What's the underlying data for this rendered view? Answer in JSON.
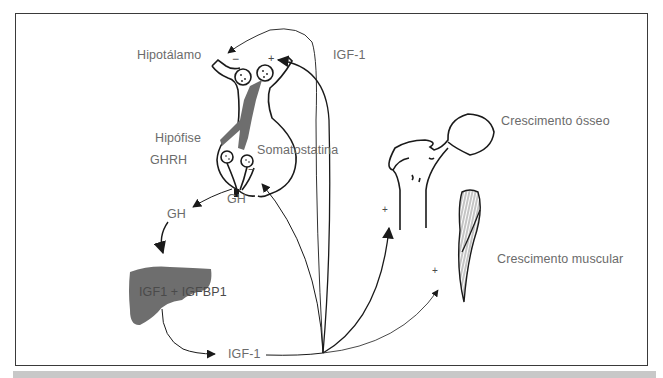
{
  "diagram": {
    "colors": {
      "frame": "#3a3a3a",
      "label": "#6b6b6b",
      "organ_fill": "#6e6e6e",
      "bottom_bar": "#c8c8c8"
    },
    "labels": {
      "hypothalamus": "Hipotálamo",
      "pituitary": "Hipófise",
      "ghrh": "GHRH",
      "somatostatin": "Somatostatina",
      "igf1_top": "IGF-1",
      "gh_pituitary": "GH",
      "gh_blood": "GH",
      "liver": "IGF1 + IGFBP1",
      "igf1_bottom": "IGF-1",
      "bone": "Crescimento ósseo",
      "muscle": "Crescimento muscular"
    },
    "signs": {
      "hypothalamus_negative": "−",
      "hypothalamus_positive": "+",
      "pituitary_negative": "−",
      "bone_positive": "+",
      "muscle_positive": "+"
    },
    "nodes": [
      {
        "id": "hypothalamus",
        "label": "Hipotálamo"
      },
      {
        "id": "pituitary",
        "label": "Hipófise"
      },
      {
        "id": "liver",
        "label": "IGF1 + IGFBP1"
      },
      {
        "id": "bone",
        "label": "Crescimento ósseo"
      },
      {
        "id": "muscle",
        "label": "Crescimento muscular"
      }
    ],
    "edges": [
      {
        "from": "pituitary",
        "to": "liver",
        "label": "GH"
      },
      {
        "from": "liver",
        "to": "igf1",
        "label": "IGF-1"
      },
      {
        "from": "igf1",
        "to": "hypothalamus",
        "sign": "−"
      },
      {
        "from": "igf1",
        "to": "hypothalamus",
        "sign": "+"
      },
      {
        "from": "igf1",
        "to": "pituitary",
        "sign": "−"
      },
      {
        "from": "igf1",
        "to": "bone",
        "sign": "+"
      },
      {
        "from": "igf1",
        "to": "muscle",
        "sign": "+"
      }
    ]
  }
}
